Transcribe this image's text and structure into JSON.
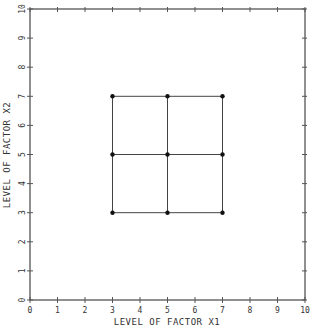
{
  "chart_data": {
    "type": "scatter",
    "title": "",
    "xlabel": "LEVEL OF FACTOR X1",
    "ylabel": "LEVEL OF FACTOR X2",
    "xlim": [
      0,
      10
    ],
    "ylim": [
      0,
      10
    ],
    "xticks": [
      "0",
      "1",
      "2",
      "3",
      "4",
      "5",
      "6",
      "7",
      "8",
      "9",
      "10"
    ],
    "yticks": [
      "0",
      "1",
      "2",
      "3",
      "4",
      "5",
      "6",
      "7",
      "8",
      "9",
      "10"
    ],
    "grid": false,
    "legend": null,
    "points": [
      {
        "x": 3,
        "y": 3
      },
      {
        "x": 5,
        "y": 3
      },
      {
        "x": 7,
        "y": 3
      },
      {
        "x": 3,
        "y": 5
      },
      {
        "x": 5,
        "y": 5
      },
      {
        "x": 7,
        "y": 5
      },
      {
        "x": 3,
        "y": 7
      },
      {
        "x": 5,
        "y": 7
      },
      {
        "x": 7,
        "y": 7
      }
    ],
    "grid_lines": {
      "x_levels": [
        3,
        5,
        7
      ],
      "y_levels": [
        3,
        5,
        7
      ]
    },
    "annotation": "3x3 factorial design grid"
  },
  "colors": {
    "axis": "#555555",
    "line": "#444444",
    "point": "#111111",
    "text": "#333333"
  }
}
